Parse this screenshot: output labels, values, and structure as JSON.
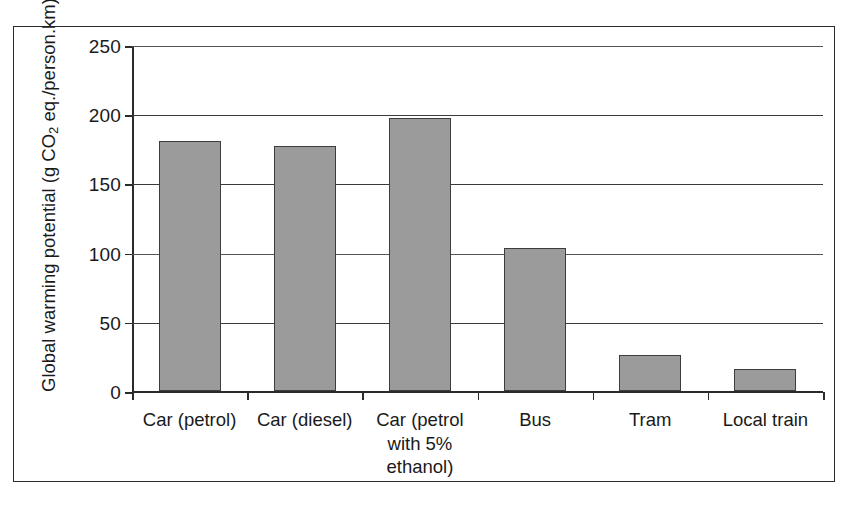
{
  "chart_data": {
    "type": "bar",
    "title": "",
    "xlabel": "",
    "ylabel": "Global warming potential (g CO2 eq./person.km)",
    "ylabel_parts": {
      "before": "Global warming potential (g CO",
      "subscript": "2",
      "after": " eq./person.km)"
    },
    "categories": [
      "Car (petrol)",
      "Car (diesel)",
      "Car (petrol\nwith 5%\nethanol)",
      "Bus",
      "Tram",
      "Local train"
    ],
    "values": [
      181,
      177,
      197,
      103,
      26,
      16
    ],
    "ylim": [
      0,
      250
    ],
    "yticks": [
      0,
      50,
      100,
      150,
      200,
      250
    ],
    "ytick_labels": [
      "0",
      "50",
      "100",
      "150",
      "200",
      "250"
    ],
    "grid": true,
    "legend": false,
    "bar_color": "#9b9b9b",
    "bar_border_color": "#3d3d3d",
    "axis_color": "#2b2b2b",
    "background_color": "#ffffff"
  }
}
